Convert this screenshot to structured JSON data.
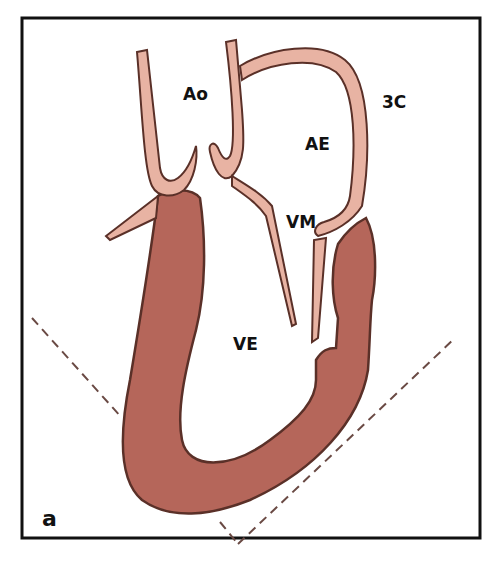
{
  "figure": {
    "panel_label": "a",
    "labels": {
      "aorta": "Ao",
      "left_atrium": "AE",
      "three_chamber": "3C",
      "mitral_valve": "VM",
      "left_ventricle": "VE"
    },
    "colors": {
      "myocardium": "#b5665a",
      "vessel_wall": "#e8b3a3",
      "outline": "#5a3028",
      "frame": "#111111",
      "dashed_sector": "#6a4a44",
      "background": "#ffffff"
    }
  }
}
